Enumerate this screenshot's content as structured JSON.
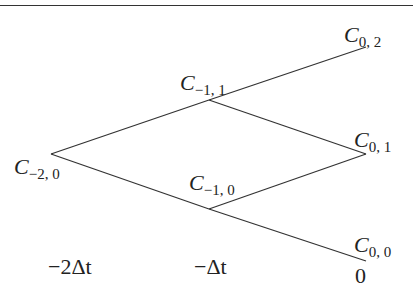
{
  "nodes": {
    "c_m2_0": {
      "sym": "C",
      "sub": "−2, 0"
    },
    "c_m1_1": {
      "sym": "C",
      "sub": "−1, 1"
    },
    "c_m1_0": {
      "sym": "C",
      "sub": "−1, 0"
    },
    "c_0_2": {
      "sym": "C",
      "sub": "0, 2"
    },
    "c_0_1": {
      "sym": "C",
      "sub": "0, 1"
    },
    "c_0_0": {
      "sym": "C",
      "sub": "0, 0"
    }
  },
  "axis": {
    "t_m2": "−2Δt",
    "t_m1": "−Δt",
    "t_0": "0"
  },
  "colors": {
    "line": "#333333",
    "background": "#ffffff"
  }
}
